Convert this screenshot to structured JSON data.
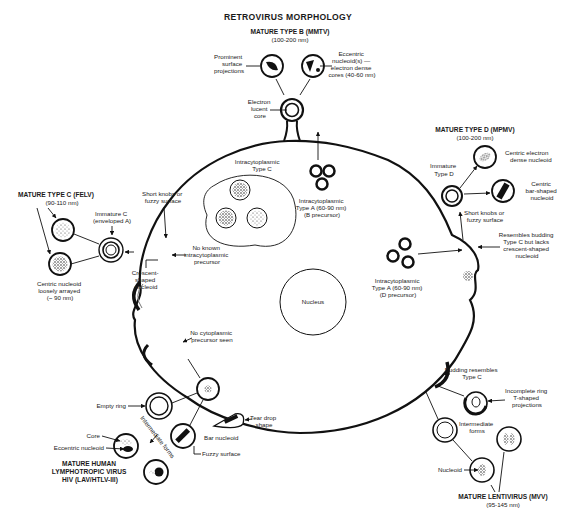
{
  "title": "RETROVIRUS MORPHOLOGY",
  "colors": {
    "ink": "#111111",
    "paper": "#ffffff",
    "stipple": "#555555"
  },
  "type_b": {
    "heading": "MATURE TYPE B (MMTV)",
    "size": "(100-200 nm)",
    "left_label": [
      "Prominent",
      "surface",
      "projections"
    ],
    "right_label": [
      "Eccentric",
      "nucleoid(s) —",
      "electron dense",
      "cores (40-60 nm)"
    ],
    "core_label": [
      "Electron",
      "lucent",
      "core"
    ]
  },
  "type_d": {
    "heading": "MATURE TYPE D (MPMV)",
    "size": "(100-200 nm)",
    "immature_label": [
      "Immature",
      "Type D"
    ],
    "centric_dense": [
      "Centric electron",
      "dense nucleoid"
    ],
    "centric_bar": [
      "Centric",
      "bar-shaped",
      "nucleoid"
    ],
    "knobs": [
      "Short knobs or",
      "fuzzy surface"
    ],
    "resembles": [
      "Resembles budding",
      "Type C but lacks",
      "crescent-shaped",
      "nucleoid"
    ]
  },
  "type_c": {
    "heading": "MATURE TYPE C (FELV)",
    "size": "(90-110 nm)",
    "immature_label": [
      "Immature C",
      "(enveloped A)"
    ],
    "knobs": [
      "Short knobs or",
      "fuzzy surface"
    ],
    "crescent": [
      "Crescent-",
      "shaped",
      "nucleoid"
    ],
    "centric": [
      "Centric nucleoid",
      "loosely arrayed",
      "(~ 90 nm)"
    ],
    "no_precursor": [
      "No known",
      "intracytoplasmic",
      "precursor"
    ]
  },
  "cell": {
    "intra_c": [
      "Intracytoplasmic",
      "Type C"
    ],
    "intra_a_b": [
      "Intracytoplasmic",
      "Type A (60-90 nm)",
      "(B precursor)"
    ],
    "intra_a_d": [
      "Intracytoplasmic",
      "Type A (60-90 nm)",
      "(D precursor)"
    ],
    "nucleus": "Nucleus"
  },
  "hiv": {
    "no_cyto": [
      "No cytoplasmic",
      "precursor seen"
    ],
    "empty_ring": "Empty ring",
    "tear_drop": [
      "Tear drop",
      "shape"
    ],
    "bar_nucleoid": "Bar nucleoid",
    "fuzzy": "Fuzzy surface",
    "core": "Core",
    "eccentric": "Eccentric nucleoid",
    "intermediate": "Intermediate forms",
    "heading": [
      "MATURE HUMAN",
      "LYMPHOTROPIC VIRUS",
      "HIV (LAV/HTLV-III)"
    ]
  },
  "lenti": {
    "budding": [
      "Budding resembles",
      "Type C"
    ],
    "incomplete": [
      "Incomplete ring",
      "T-shaped",
      "projections"
    ],
    "intermediate": [
      "Intermediate",
      "forms"
    ],
    "nucleoid": "Nucleoid",
    "heading": "MATURE LENTIVIRUS (MVV)",
    "size": "(95-145 nm)"
  }
}
